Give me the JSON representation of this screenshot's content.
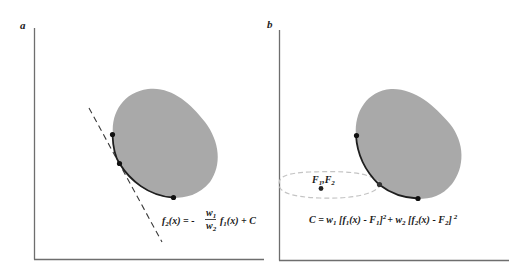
{
  "figure": {
    "panels": [
      {
        "id": "a",
        "label": "a",
        "equation": {
          "lhs": "f",
          "lhs_sub": "2",
          "lhs_arg": "(x) = -",
          "frac_num": "w",
          "frac_num_sub": "1",
          "frac_den": "w",
          "frac_den_sub": "2",
          "rhs": "f",
          "rhs_sub": "1",
          "rhs_arg": "(x) + C",
          "full_text": "f2(x) = - (w1/w2) f1(x) + C"
        },
        "elements": [
          "feasible region (gray blob)",
          "Pareto front arc",
          "dashed tangent line",
          "3 points"
        ]
      },
      {
        "id": "b",
        "label": "b",
        "target_label": "F",
        "target_sub1": "1",
        "target_sep": ",F",
        "target_sub2": "2",
        "equation": {
          "full_text": "C = w1 [f1(x) - F1]^2 + w2 [f2(x) - F2]^2",
          "part1": "C = w",
          "sub1": "1",
          "part2": " [f",
          "sub2": "1",
          "part3": "(x) - F",
          "sub3": "1",
          "part4": "]",
          "sup1": "2",
          "part5": "+ w",
          "sub4": "2",
          "part6": " [f",
          "sub5": "2",
          "part7": "(x) - F",
          "sub6": "2",
          "part8": "]",
          "sup2": "2"
        },
        "elements": [
          "feasible region (gray blob)",
          "Pareto front arc",
          "dashed ellipse contour",
          "target point",
          "3 points"
        ]
      }
    ],
    "colors": {
      "region_fill": "#a9a9a9",
      "axis": "#6e6e6e",
      "curve": "#1e1e1e",
      "dashed_line": "#3a3a3a",
      "ellipse": "#c4c4c4"
    }
  }
}
